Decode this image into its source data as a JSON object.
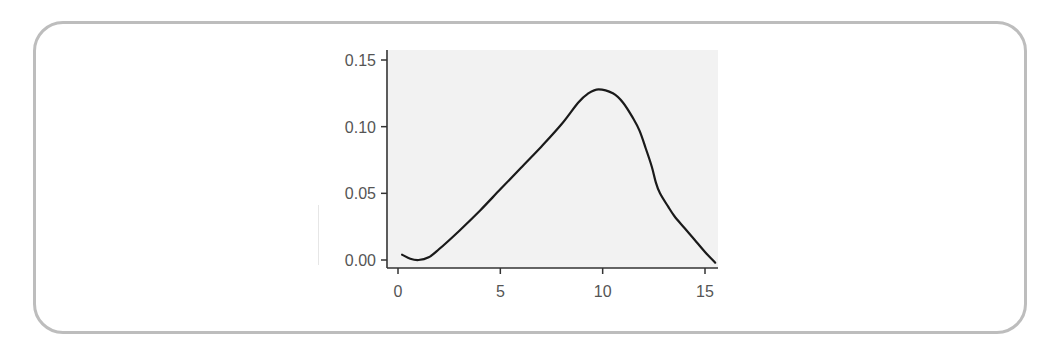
{
  "chart_data": {
    "type": "line",
    "title": "",
    "xlabel": "",
    "ylabel": "",
    "xlim": [
      -0.5,
      15.6
    ],
    "ylim": [
      -0.006,
      0.158
    ],
    "xticks": [
      0,
      5,
      10,
      15
    ],
    "xtick_labels": [
      "0",
      "5",
      "10",
      "15"
    ],
    "yticks": [
      0.0,
      0.05,
      0.1,
      0.15
    ],
    "ytick_labels": [
      "0.00",
      "0.05",
      "0.10",
      "0.15"
    ],
    "grid": false,
    "legend": null,
    "series": [
      {
        "name": "density",
        "color": "#1a1a1a",
        "x": [
          0.2,
          0.6,
          1.0,
          1.5,
          2.0,
          3.0,
          4.0,
          5.0,
          6.0,
          7.0,
          8.0,
          8.8,
          9.3,
          9.8,
          10.5,
          11.0,
          11.5,
          11.8,
          12.1,
          12.4,
          12.6,
          12.8,
          13.2,
          13.5,
          14.0,
          14.5,
          15.0,
          15.5
        ],
        "y": [
          0.004,
          0.001,
          0.0,
          0.002,
          0.008,
          0.022,
          0.037,
          0.053,
          0.069,
          0.085,
          0.102,
          0.118,
          0.125,
          0.128,
          0.125,
          0.118,
          0.106,
          0.097,
          0.084,
          0.07,
          0.058,
          0.05,
          0.04,
          0.033,
          0.024,
          0.015,
          0.006,
          -0.002
        ]
      }
    ]
  },
  "colors": {
    "card_border": "#bdbdbd",
    "plot_background": "#f2f2f2",
    "axis": "#333333",
    "line": "#1a1a1a",
    "tick_label": "#555555"
  }
}
